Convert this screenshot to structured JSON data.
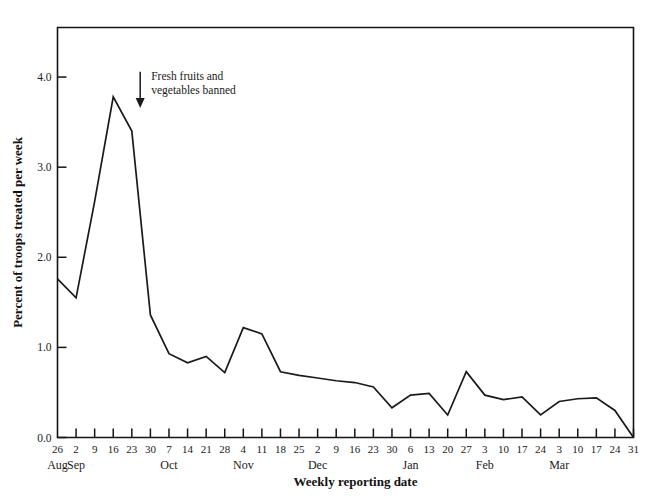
{
  "chart_data": {
    "type": "line",
    "title": "",
    "xlabel": "Weekly reporting date",
    "ylabel": "Percent of troops treated per week",
    "ylim": [
      0.0,
      4.55
    ],
    "yticks": [
      "0.0",
      "1.0",
      "2.0",
      "3.0",
      "4.0"
    ],
    "ytick_values": [
      0.0,
      1.0,
      2.0,
      3.0,
      4.0
    ],
    "grid": false,
    "legend": "none",
    "categories": [
      "26",
      "2",
      "9",
      "16",
      "23",
      "30",
      "7",
      "14",
      "21",
      "28",
      "4",
      "11",
      "18",
      "25",
      "2",
      "9",
      "16",
      "23",
      "30",
      "6",
      "13",
      "20",
      "27",
      "3",
      "10",
      "17",
      "24",
      "3",
      "10",
      "17",
      "24",
      "31"
    ],
    "month_groups": [
      {
        "label": "Aug",
        "start_index": 0
      },
      {
        "label": "Sep",
        "start_index": 1
      },
      {
        "label": "Oct",
        "start_index": 6
      },
      {
        "label": "Nov",
        "start_index": 10
      },
      {
        "label": "Dec",
        "start_index": 14
      },
      {
        "label": "Jan",
        "start_index": 19
      },
      {
        "label": "Feb",
        "start_index": 23
      },
      {
        "label": "Mar",
        "start_index": 27
      }
    ],
    "values": [
      1.76,
      1.55,
      2.62,
      3.78,
      3.4,
      1.36,
      0.93,
      0.83,
      0.9,
      0.72,
      1.22,
      1.15,
      0.73,
      0.69,
      0.66,
      0.63,
      0.61,
      0.56,
      0.33,
      0.47,
      0.49,
      0.25,
      0.73,
      0.47,
      0.42,
      0.45,
      0.25,
      0.4,
      0.43,
      0.44,
      0.3,
      0.0
    ],
    "annotations": [
      {
        "name": "fresh-fruits-banned",
        "line1": "Fresh fruits and",
        "line2": "vegetables banned",
        "arrow_x_index": 4.45,
        "arrow_y_top": 4.06,
        "arrow_y_bottom": 3.69
      }
    ],
    "line_color": "#1a1a1a",
    "axis_color": "#141414"
  }
}
